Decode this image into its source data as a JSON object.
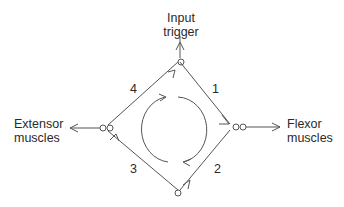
{
  "diagram": {
    "type": "reciprocal-inhibition-oscillator",
    "nodes": {
      "input": {
        "line1": "Input",
        "line2": "trigger"
      },
      "left": {
        "line1": "Extensor",
        "line2": "muscles"
      },
      "right": {
        "line1": "Flexor",
        "line2": "muscles"
      }
    },
    "edge_labels": {
      "top_right": "1",
      "bottom_right": "2",
      "bottom_left": "3",
      "top_left": "4"
    },
    "cycle_direction": "clockwise",
    "colors": {
      "line": "#555555",
      "text": "#2a2a2a",
      "background": "#ffffff"
    }
  }
}
